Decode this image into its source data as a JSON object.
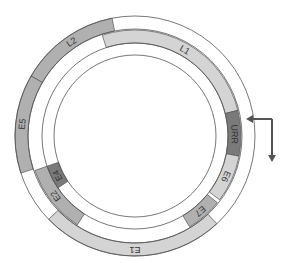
{
  "diagram": {
    "type": "circular genome map",
    "center": [
      135,
      136
    ],
    "rings": {
      "outer": {
        "r_out": 120,
        "r_in": 107
      },
      "middle": {
        "r_out": 106,
        "r_in": 93
      },
      "inner": {
        "r_out": 93,
        "r_in": 81
      }
    },
    "colors": {
      "stroke": "#555555",
      "light": "#d4d4d4",
      "mid": "#b0b0b0",
      "dark": "#7a7a7a"
    },
    "segments": [
      {
        "label": "L2",
        "ring": "outer",
        "start": 300,
        "end": 349,
        "shade": "mid",
        "label_angle": 326
      },
      {
        "label": "E5",
        "ring": "outer",
        "start": 252,
        "end": 300,
        "shade": "mid",
        "label_angle": 276
      },
      {
        "label": "E1",
        "ring": "outer",
        "start": 137,
        "end": 226,
        "shade": "light",
        "label_angle": 180
      },
      {
        "label": "L1",
        "ring": "middle",
        "start": -18,
        "end": 76,
        "shade": "light",
        "label_angle": 30
      },
      {
        "label": "URR",
        "ring": "middle",
        "start": 76,
        "end": 101,
        "shade": "dark",
        "label_angle": 89
      },
      {
        "label": "E6",
        "ring": "middle",
        "start": 101,
        "end": 127,
        "shade": "light",
        "label_angle": 114
      },
      {
        "label": "E7",
        "ring": "middle",
        "start": 129,
        "end": 149,
        "shade": "mid",
        "label_angle": 139
      },
      {
        "label": "E2",
        "ring": "middle",
        "start": 213,
        "end": 251,
        "shade": "mid",
        "label_angle": 233
      },
      {
        "label": "E4",
        "ring": "inner",
        "start": 236,
        "end": 251,
        "shade": "dark",
        "label_angle": 243
      }
    ],
    "promoter_arrow": {
      "label": "",
      "description": "transcription start arrow"
    }
  }
}
